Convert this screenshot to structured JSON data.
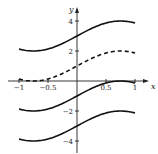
{
  "chart_data": {
    "type": "line",
    "title": "",
    "xlabel": "x",
    "ylabel": "y",
    "xlim": [
      -1,
      1
    ],
    "ylim": [
      -4.5,
      4.5
    ],
    "grid": false,
    "legend": null,
    "x_ticks": [
      -1,
      -0.5,
      0.5,
      1
    ],
    "x_tick_labels": [
      "−1",
      "−0.5",
      "0.5",
      "1"
    ],
    "y_ticks": [
      4,
      2,
      -2,
      -4
    ],
    "y_tick_labels": [
      "4",
      "2",
      "−2",
      "−4"
    ],
    "x": [
      -1,
      -0.75,
      -0.5,
      -0.25,
      0,
      0.25,
      0.5,
      0.75,
      1
    ],
    "series": [
      {
        "name": "C=3",
        "style": "solid",
        "values": [
          2.13,
          2.0,
          2.13,
          2.5,
          3.0,
          3.5,
          3.87,
          4.0,
          3.87
        ]
      },
      {
        "name": "C=1",
        "style": "dashed",
        "values": [
          0.13,
          0.0,
          0.13,
          0.5,
          1.0,
          1.5,
          1.87,
          2.0,
          1.87
        ]
      },
      {
        "name": "C=-1",
        "style": "solid",
        "values": [
          -1.87,
          -2.0,
          -1.87,
          -1.5,
          -1.0,
          -0.5,
          -0.13,
          0.0,
          -0.13
        ]
      },
      {
        "name": "C=-3",
        "style": "solid",
        "values": [
          -3.87,
          -4.0,
          -3.87,
          -3.5,
          -3.0,
          -2.5,
          -2.13,
          -2.0,
          -2.13
        ]
      }
    ],
    "annotations": []
  },
  "layout": {
    "origin_px": [
      77,
      81
    ],
    "x_px_per_unit": 58,
    "y_px_per_unit": 15,
    "x_axis_range_px": [
      8,
      149
    ],
    "y_axis_range_px": [
      7,
      153
    ]
  }
}
